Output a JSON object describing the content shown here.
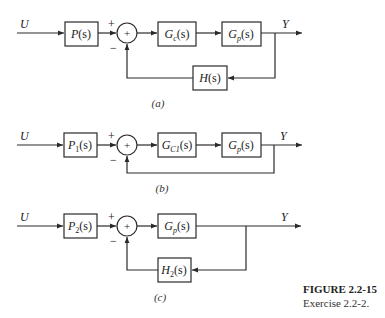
{
  "diagrams": [
    {
      "id": "a",
      "caption": "(a)",
      "input_label": "U",
      "output_label": "Y",
      "blocks": {
        "prefilter": {
          "name": "P",
          "sub": "",
          "arg": "(s)"
        },
        "controller": {
          "name": "G",
          "sub": "c",
          "arg": "(s)"
        },
        "plant": {
          "name": "G",
          "sub": "p",
          "arg": "(s)"
        },
        "feedback": {
          "name": "H",
          "sub": "",
          "arg": "(s)"
        }
      },
      "summing_junction": {
        "symbol": "+",
        "plus": "+",
        "minus": "−"
      }
    },
    {
      "id": "b",
      "caption": "(b)",
      "input_label": "U",
      "output_label": "Y",
      "blocks": {
        "prefilter": {
          "name": "P",
          "sub": "1",
          "arg": "(s)"
        },
        "controller": {
          "name": "G",
          "sub": "C1",
          "arg": "(s)"
        },
        "plant": {
          "name": "G",
          "sub": "p",
          "arg": "(s)"
        }
      },
      "summing_junction": {
        "symbol": "+",
        "plus": "+",
        "minus": "−"
      }
    },
    {
      "id": "c",
      "caption": "(c)",
      "input_label": "U",
      "output_label": "Y",
      "blocks": {
        "prefilter": {
          "name": "P",
          "sub": "2",
          "arg": "(s)"
        },
        "plant": {
          "name": "G",
          "sub": "p",
          "arg": "(s)"
        },
        "feedback": {
          "name": "H",
          "sub": "2",
          "arg": "(s)"
        }
      },
      "summing_junction": {
        "symbol": "+",
        "plus": "+",
        "minus": "−"
      }
    }
  ],
  "figure": {
    "title": "FIGURE 2.2-15",
    "subtitle": "Exercise 2.2-2."
  }
}
